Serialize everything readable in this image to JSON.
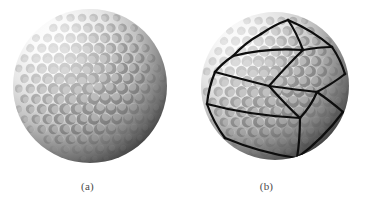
{
  "figure": {
    "background_color": "#ffffff",
    "width": 370,
    "height": 200,
    "panel_count": 2
  },
  "panels": [
    {
      "id": "a",
      "caption": "(a)",
      "subject": "golf-ball",
      "description": "Grayscale photograph of a golf ball showing its dimpled surface",
      "overlay": "none",
      "ball": {
        "center_x": 90,
        "center_y": 86,
        "radius": 77,
        "highlight_x": 55,
        "highlight_y": 44,
        "highlight_color": "#fdfdfd",
        "midtone_color": "#c9c9c9",
        "shadow_color": "#3b3b3b",
        "terminator_color": "#2c2c2c",
        "dimple_count": 250,
        "dimple_radius": 6.0
      }
    },
    {
      "id": "b",
      "caption": "(b)",
      "subject": "golf-ball-with-mesh",
      "description": "Same golf ball overlaid with a black polygonal mesh of surface patch boundaries",
      "overlay": "polygon-mesh",
      "ball": {
        "center_x": 90,
        "center_y": 86,
        "radius": 74,
        "highlight_x": 52,
        "highlight_y": 44,
        "highlight_color": "#fbfbfb",
        "midtone_color": "#c4c4c4",
        "shadow_color": "#3a3a3a",
        "terminator_color": "#2a2a2a",
        "dimple_count": 250,
        "dimple_radius": 6.0
      },
      "mesh": {
        "stroke_color": "#0d0d0d",
        "stroke_width": 2.2,
        "node_count": 14,
        "edge_count": 21,
        "nodes": [
          {
            "id": "n0",
            "x": 30,
            "y": 72
          },
          {
            "id": "n1",
            "x": 48,
            "y": 56
          },
          {
            "id": "n2",
            "x": 76,
            "y": 34
          },
          {
            "id": "n3",
            "x": 103,
            "y": 20
          },
          {
            "id": "n4",
            "x": 118,
            "y": 50
          },
          {
            "id": "n5",
            "x": 147,
            "y": 47
          },
          {
            "id": "n6",
            "x": 84,
            "y": 86
          },
          {
            "id": "n7",
            "x": 132,
            "y": 92
          },
          {
            "id": "n8",
            "x": 22,
            "y": 104
          },
          {
            "id": "n9",
            "x": 115,
            "y": 118
          },
          {
            "id": "n10",
            "x": 40,
            "y": 138
          },
          {
            "id": "n11",
            "x": 160,
            "y": 74
          },
          {
            "id": "n12",
            "x": 158,
            "y": 112
          },
          {
            "id": "n13",
            "x": 112,
            "y": 158
          }
        ],
        "edges": [
          [
            "n0",
            "n1"
          ],
          [
            "n1",
            "n2"
          ],
          [
            "n2",
            "n3"
          ],
          [
            "n3",
            "n4"
          ],
          [
            "n4",
            "n5"
          ],
          [
            "n1",
            "n4"
          ],
          [
            "n0",
            "n8"
          ],
          [
            "n4",
            "n6"
          ],
          [
            "n6",
            "n9"
          ],
          [
            "n8",
            "n10"
          ],
          [
            "n6",
            "n7"
          ],
          [
            "n7",
            "n9"
          ],
          [
            "n5",
            "n11"
          ],
          [
            "n7",
            "n11"
          ],
          [
            "n7",
            "n12"
          ],
          [
            "n9",
            "n13"
          ],
          [
            "n10",
            "n13"
          ],
          [
            "n0",
            "n6"
          ],
          [
            "n8",
            "n9"
          ],
          [
            "n12",
            "n13"
          ],
          [
            "n3",
            "n5"
          ]
        ]
      }
    }
  ]
}
